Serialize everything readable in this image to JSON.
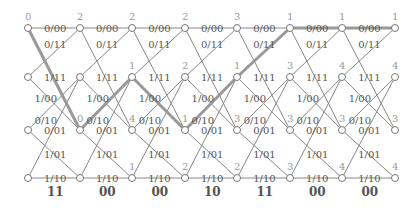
{
  "diagram": {
    "type": "viterbi-trellis",
    "columns_x": [
      28,
      80,
      132,
      185,
      237,
      290,
      342,
      395
    ],
    "rows_y": [
      28,
      77,
      130,
      178
    ],
    "colors": {
      "edge": "#888888",
      "survivor": "#999999",
      "node_stroke": "#777777",
      "label": "#555555",
      "metric": "#999999"
    },
    "branches": [
      {
        "from": 0,
        "to": 0,
        "label": "0/00"
      },
      {
        "from": 0,
        "to": 2,
        "label": "0/11"
      },
      {
        "from": 1,
        "to": 0,
        "label": "1/11"
      },
      {
        "from": 1,
        "to": 2,
        "label": "1/00"
      },
      {
        "from": 2,
        "to": 1,
        "label": "0/10"
      },
      {
        "from": 2,
        "to": 3,
        "label": "0/01"
      },
      {
        "from": 3,
        "to": 1,
        "label": "1/01"
      },
      {
        "from": 3,
        "to": 3,
        "label": "1/10"
      }
    ],
    "metrics": [
      [
        "0",
        null,
        null,
        null
      ],
      [
        "2",
        null,
        "0",
        null
      ],
      [
        "2",
        "1",
        "4",
        "1"
      ],
      [
        "2",
        "2",
        "1",
        "2"
      ],
      [
        "3",
        "1",
        "3",
        "2"
      ],
      [
        "1",
        "3",
        "3",
        "3"
      ],
      [
        "1",
        "4",
        "3",
        "4"
      ],
      [
        "1",
        "4",
        "3",
        "4"
      ]
    ],
    "received": [
      "11",
      "00",
      "00",
      "10",
      "11",
      "00",
      "00"
    ],
    "survivor_path_rows": [
      0,
      2,
      1,
      2,
      1,
      0,
      0,
      0
    ]
  }
}
